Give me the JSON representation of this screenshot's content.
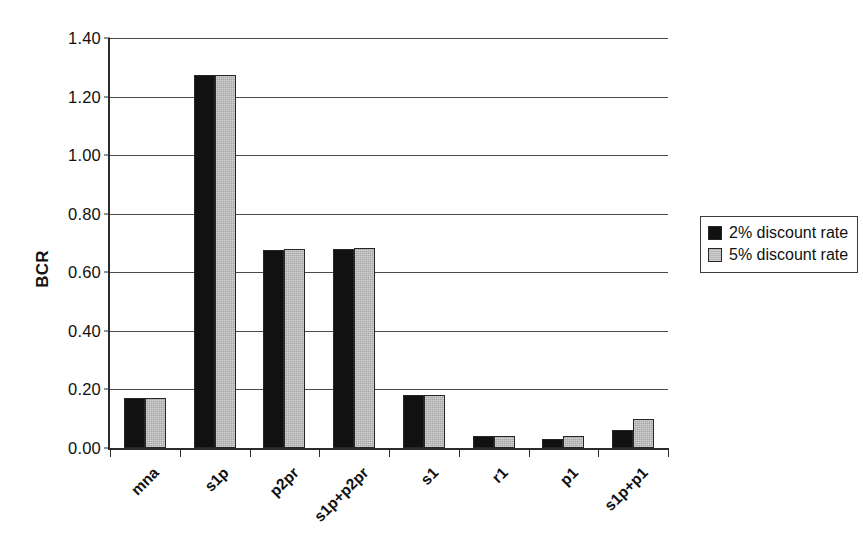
{
  "chart_data": {
    "type": "bar",
    "title": "",
    "xlabel": "",
    "ylabel": "BCR",
    "ylim": [
      0.0,
      1.4
    ],
    "ytick_labels": [
      "1.40",
      "1.20",
      "1.00",
      "0.80",
      "0.60",
      "0.40",
      "0.20",
      "0.00"
    ],
    "ytick_values": [
      1.4,
      1.2,
      1.0,
      0.8,
      0.6,
      0.4,
      0.2,
      0.0
    ],
    "grid": "horizontal",
    "legend_position": "right",
    "categories": [
      "mna",
      "s1p",
      "p2pr",
      "s1p+p2pr",
      "s1",
      "r1",
      "p1",
      "s1p+p1"
    ],
    "series": [
      {
        "name": "2% discount rate",
        "color": "#111111",
        "values": [
          0.17,
          1.275,
          0.675,
          0.68,
          0.18,
          0.04,
          0.03,
          0.06
        ]
      },
      {
        "name": "5% discount rate",
        "color": "#a8a8a8",
        "values": [
          0.17,
          1.275,
          0.678,
          0.682,
          0.18,
          0.04,
          0.04,
          0.1
        ]
      }
    ]
  },
  "legend": {
    "entries": [
      {
        "label": "2% discount rate"
      },
      {
        "label": "5% discount rate"
      }
    ]
  },
  "axis": {
    "y_title": "BCR"
  }
}
